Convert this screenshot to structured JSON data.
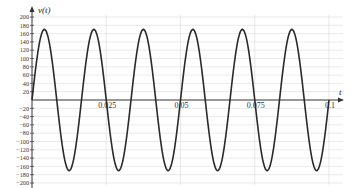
{
  "chart_data": {
    "type": "line",
    "title": "",
    "xlabel": "t",
    "ylabel": "v(t)",
    "xlim": [
      0,
      0.1
    ],
    "ylim": [
      -200,
      200
    ],
    "grid": true,
    "legend": null,
    "x_ticks": [
      0.025,
      0.05,
      0.075,
      0.1
    ],
    "x_tick_labels": [
      "0.025",
      "0.05",
      "0.075",
      "0.1"
    ],
    "y_ticks": [
      200,
      180,
      160,
      140,
      120,
      100,
      80,
      60,
      40,
      20,
      -20,
      -40,
      -60,
      -80,
      -100,
      -120,
      -140,
      -160,
      -180,
      -200
    ],
    "y_tick_labels": [
      "200",
      "180",
      "160",
      "140",
      "120",
      "100",
      "80",
      "60",
      "40",
      "20",
      "−20",
      "−40",
      "−60",
      "−80",
      "−100",
      "−120",
      "−140",
      "−160",
      "−180",
      "−200"
    ],
    "series": [
      {
        "name": "v(t)",
        "function": "170*sin(2*pi*60*t)",
        "amplitude": 170,
        "frequency_hz": 60,
        "color": "#2a2a2a",
        "x": [
          0,
          0.004167,
          0.008333,
          0.0125,
          0.016667,
          0.020833,
          0.025,
          0.029167,
          0.033333,
          0.0375,
          0.041667,
          0.045833,
          0.05,
          0.054167,
          0.058333,
          0.0625,
          0.066667,
          0.070833,
          0.075,
          0.079167,
          0.083333,
          0.0875,
          0.091667,
          0.095833,
          0.1
        ],
        "values": [
          0,
          170,
          0,
          -170,
          0,
          170,
          0,
          -170,
          0,
          170,
          0,
          -170,
          0,
          170,
          0,
          -170,
          0,
          170,
          0,
          -170,
          0,
          170,
          0,
          -170,
          0
        ]
      }
    ]
  },
  "labels": {
    "y_axis": "v(t)",
    "x_axis": "t"
  }
}
